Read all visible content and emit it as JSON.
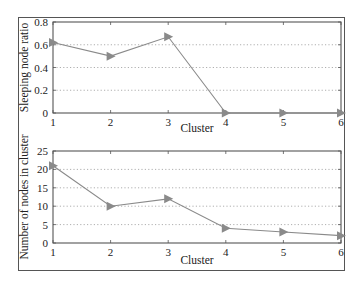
{
  "chart_data": [
    {
      "type": "line",
      "title": "",
      "xlabel": "Cluster",
      "ylabel": "Sleeping node ratio",
      "x": [
        1,
        2,
        3,
        4,
        5,
        6
      ],
      "xticks": [
        "1",
        "2",
        "3",
        "4",
        "5",
        "6"
      ],
      "yticks": [
        "0",
        "0.2",
        "0.4",
        "0.6",
        "0.8"
      ],
      "ylim": [
        0,
        0.8
      ],
      "xlim": [
        1,
        6
      ],
      "grid": "horizontal-dotted",
      "marker": "right-triangle",
      "series": [
        {
          "name": "Sleeping node ratio",
          "values": [
            0.62,
            0.5,
            0.67,
            0,
            0,
            0
          ]
        }
      ]
    },
    {
      "type": "line",
      "title": "",
      "xlabel": "Cluster",
      "ylabel": "Number of nodes in cluster",
      "x": [
        1,
        2,
        3,
        4,
        5,
        6
      ],
      "xticks": [
        "1",
        "2",
        "3",
        "4",
        "5",
        "6"
      ],
      "yticks": [
        "0",
        "5",
        "10",
        "15",
        "20",
        "25"
      ],
      "ylim": [
        0,
        25
      ],
      "xlim": [
        1,
        6
      ],
      "grid": "horizontal-dotted",
      "marker": "right-triangle",
      "series": [
        {
          "name": "Number of nodes",
          "values": [
            21,
            10,
            12,
            4,
            3,
            2
          ]
        }
      ]
    }
  ],
  "style": {
    "line_color": "#8a8a8a",
    "marker_color": "#8a8a8a",
    "axis_color": "#555555",
    "grid_color": "#9a9a9a",
    "frame_color": "#555555"
  }
}
